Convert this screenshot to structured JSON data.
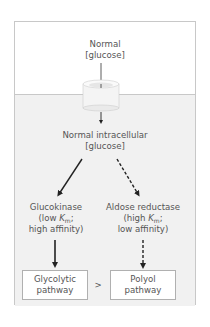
{
  "diagram": {
    "extracellular_label": {
      "line1": "Normal",
      "line2": "[glucose]"
    },
    "transporter": "glucose-transporter-cylinder",
    "intracellular_label": {
      "line1": "Normal intracellular",
      "line2": "[glucose]"
    },
    "left_enzyme": {
      "name": "Glucokinase",
      "km_prefix": "(low ",
      "km_symbol": "K",
      "km_sub": "m",
      "km_suffix": ";",
      "affinity": "high affinity)"
    },
    "right_enzyme": {
      "name": "Aldose reductase",
      "km_prefix": "(high ",
      "km_symbol": "K",
      "km_sub": "m",
      "km_suffix": ";",
      "affinity": "low affinity)"
    },
    "left_pathway": {
      "line1": "Glycolytic",
      "line2": "pathway"
    },
    "right_pathway": {
      "line1": "Polyol",
      "line2": "pathway"
    },
    "comparison": ">",
    "arrows": {
      "left": "solid",
      "right": "dashed"
    },
    "colors": {
      "cell_fill": "#f1f1f1",
      "border": "#c8c8c8",
      "text": "#555555",
      "arrow": "#222222"
    }
  }
}
